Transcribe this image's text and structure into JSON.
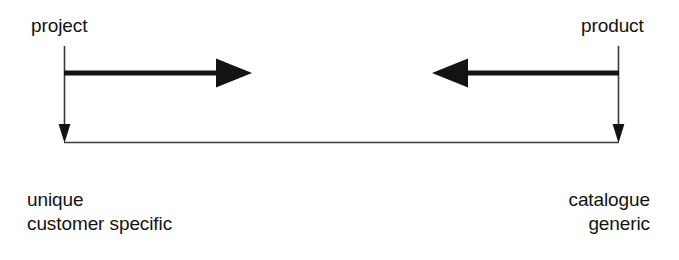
{
  "diagram": {
    "title_left": "project",
    "title_right": "product",
    "left_axis_caption": {
      "line1": "unique",
      "line2": "customer specific"
    },
    "right_axis_caption": {
      "line1": "catalogue",
      "line2": "generic"
    },
    "colors": {
      "ink": "#131313",
      "thin_rule": "#3a3a3a",
      "background": "#ffffff"
    },
    "arrows": [
      {
        "name": "left-to-right-arrow",
        "direction": "right",
        "from_x": 64,
        "to_x": 252,
        "y": 73
      },
      {
        "name": "right-to-left-arrow",
        "direction": "left",
        "from_x": 618,
        "to_x": 432,
        "y": 73
      },
      {
        "name": "left-down-arrow",
        "direction": "down",
        "x": 64,
        "from_y": 46,
        "to_y": 142
      },
      {
        "name": "right-down-arrow",
        "direction": "down",
        "x": 618,
        "from_y": 46,
        "to_y": 142
      }
    ],
    "baseline": {
      "name": "baseline-connector",
      "x1": 64,
      "x2": 618,
      "y": 142
    }
  }
}
